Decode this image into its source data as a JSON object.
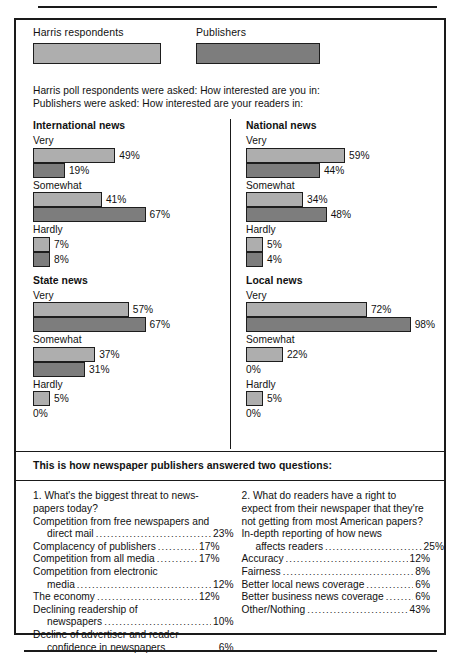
{
  "legend": {
    "items": [
      {
        "label": "Harris respondents",
        "color": "#aeaeae",
        "key": "harris"
      },
      {
        "label": "Publishers",
        "color": "#7d7d7d",
        "key": "publishers"
      }
    ]
  },
  "intro": {
    "line1": "Harris poll respondents were asked: How interested are you in:",
    "line2": "Publishers were asked: How interested are your readers in:"
  },
  "chart_data": {
    "type": "bar",
    "title": "How interested are you in:",
    "orientation": "horizontal",
    "categories": [
      "Very",
      "Somewhat",
      "Hardly"
    ],
    "series_names": [
      "Harris respondents",
      "Publishers"
    ],
    "xlabel": "",
    "ylabel": "",
    "xlim": [
      0,
      100
    ],
    "grid": false,
    "legend_position": "top",
    "panels": [
      {
        "title": "International news",
        "groups": [
          {
            "label": "Very",
            "harris": 49,
            "publishers": 19,
            "harris_text": "49%",
            "publishers_text": "19%"
          },
          {
            "label": "Somewhat",
            "harris": 41,
            "publishers": 67,
            "harris_text": "41%",
            "publishers_text": "67%"
          },
          {
            "label": "Hardly",
            "harris": 7,
            "publishers": 8,
            "harris_text": "7%",
            "publishers_text": "8%"
          }
        ]
      },
      {
        "title": "National news",
        "groups": [
          {
            "label": "Very",
            "harris": 59,
            "publishers": 44,
            "harris_text": "59%",
            "publishers_text": "44%"
          },
          {
            "label": "Somewhat",
            "harris": 34,
            "publishers": 48,
            "harris_text": "34%",
            "publishers_text": "48%"
          },
          {
            "label": "Hardly",
            "harris": 5,
            "publishers": 4,
            "harris_text": "5%",
            "publishers_text": "4%"
          }
        ]
      },
      {
        "title": "State news",
        "groups": [
          {
            "label": "Very",
            "harris": 57,
            "publishers": 67,
            "harris_text": "57%",
            "publishers_text": "67%"
          },
          {
            "label": "Somewhat",
            "harris": 37,
            "publishers": 31,
            "harris_text": "37%",
            "publishers_text": "31%"
          },
          {
            "label": "Hardly",
            "harris": 5,
            "publishers": 0,
            "harris_text": "5%",
            "publishers_text": "0%"
          }
        ]
      },
      {
        "title": "Local news",
        "groups": [
          {
            "label": "Very",
            "harris": 72,
            "publishers": 98,
            "harris_text": "72%",
            "publishers_text": "98%"
          },
          {
            "label": "Somewhat",
            "harris": 22,
            "publishers": 0,
            "harris_text": "22%",
            "publishers_text": "0%"
          },
          {
            "label": "Hardly",
            "harris": 5,
            "publishers": 0,
            "harris_text": "5%",
            "publishers_text": "0%"
          }
        ]
      }
    ]
  },
  "footer": {
    "band_title": "This is how newspaper publishers answered two questions:",
    "questions": [
      {
        "number": "1.",
        "prompt_lines": [
          "1.  What's the biggest threat to news-",
          "papers today?"
        ],
        "items": [
          {
            "label_lines": [
              "Competition from free newspapers and",
              "direct mail"
            ],
            "value": "23%"
          },
          {
            "label_lines": [
              "Complacency of publishers"
            ],
            "value": "17%"
          },
          {
            "label_lines": [
              "Competition from all media"
            ],
            "value": "17%"
          },
          {
            "label_lines": [
              "Competition from electronic",
              "media"
            ],
            "value": "12%"
          },
          {
            "label_lines": [
              "The economy"
            ],
            "value": "12%"
          },
          {
            "label_lines": [
              "Declining readership of",
              "newspapers"
            ],
            "value": "10%"
          },
          {
            "label_lines": [
              "Decline of advertiser and reader",
              "confidence in newspapers"
            ],
            "value": "6%"
          }
        ]
      },
      {
        "number": "2.",
        "prompt_lines": [
          "2.  What do readers have a right to",
          "expect from their newspaper that they're",
          "not getting from most American papers?"
        ],
        "items": [
          {
            "label_lines": [
              "In-depth reporting of how news",
              "affects readers"
            ],
            "value": "25%"
          },
          {
            "label_lines": [
              "Accuracy"
            ],
            "value": "12%"
          },
          {
            "label_lines": [
              "Fairness"
            ],
            "value": "8%"
          },
          {
            "label_lines": [
              "Better local news coverage"
            ],
            "value": "6%"
          },
          {
            "label_lines": [
              "Better business news coverage"
            ],
            "value": "6%"
          },
          {
            "label_lines": [
              "Other/Nothing"
            ],
            "value": "43%"
          }
        ]
      }
    ]
  },
  "colors": {
    "harris": "#aeaeae",
    "publishers": "#7d7d7d",
    "ink": "#1a1a1a",
    "paper": "#ffffff"
  }
}
